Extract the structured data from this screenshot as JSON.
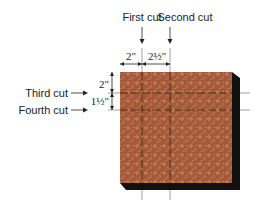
{
  "labels": {
    "first_cut": "First cut",
    "second_cut": "Second cut",
    "third_cut": "Third cut",
    "fourth_cut": "Fourth cut"
  },
  "dimensions": {
    "h1": "2\"",
    "h2": "2½\"",
    "v1": "2\"",
    "v2": "1½\""
  },
  "colors": {
    "fabric": "#a45a3a",
    "fabric_dots": "#d89a70",
    "shadow": "#111111",
    "cut_line": "#3a2418",
    "guide_line": "#888888"
  }
}
